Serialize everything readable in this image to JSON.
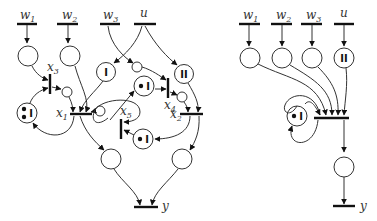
{
  "left_diagram": {
    "inputs": [
      {
        "label": "w",
        "sub": "1"
      },
      {
        "label": "w",
        "sub": "2"
      },
      {
        "label": "w",
        "sub": "3"
      },
      {
        "label": "u",
        "sub": ""
      }
    ],
    "transitions": [
      {
        "label": "x",
        "sub": "1"
      },
      {
        "label": "x",
        "sub": "2"
      },
      {
        "label": "x",
        "sub": "3"
      },
      {
        "label": "x",
        "sub": "4"
      },
      {
        "label": "x",
        "sub": "5"
      }
    ],
    "place_marks": {
      "I": "I",
      "II": "II",
      "dot_I": "I",
      "dots_I": "I"
    },
    "output": {
      "label": "y"
    }
  },
  "right_diagram": {
    "inputs": [
      {
        "label": "w",
        "sub": "1"
      },
      {
        "label": "w",
        "sub": "2"
      },
      {
        "label": "w",
        "sub": "3"
      },
      {
        "label": "u",
        "sub": ""
      }
    ],
    "place_marks": {
      "II": "II",
      "dot_I": "I"
    },
    "output": {
      "label": "y"
    }
  }
}
